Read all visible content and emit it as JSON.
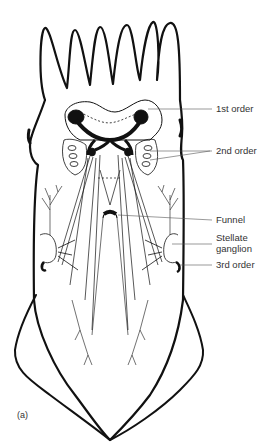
{
  "figure": {
    "panel_label": "(a)",
    "labels": [
      {
        "id": "first-order",
        "text": "1st order"
      },
      {
        "id": "second-order",
        "text": "2nd order"
      },
      {
        "id": "funnel",
        "text": "Funnel"
      },
      {
        "id": "stellate-ganglion-line1",
        "text": "Stellate"
      },
      {
        "id": "stellate-ganglion-line2",
        "text": "ganglion"
      },
      {
        "id": "third-order",
        "text": "3rd order"
      }
    ],
    "colors": {
      "ink": "#111111",
      "label": "#333333",
      "background": "#ffffff"
    }
  }
}
